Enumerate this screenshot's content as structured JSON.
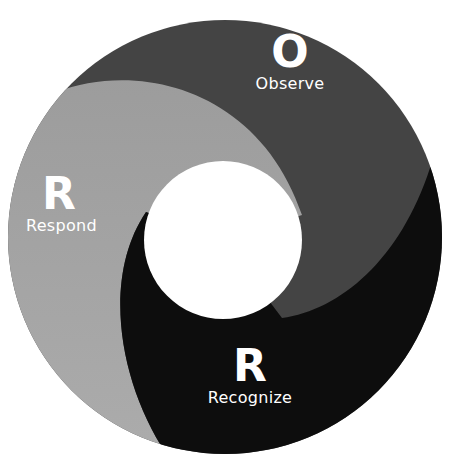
{
  "diagram": {
    "colors": {
      "observe": "#444444",
      "respond_top": "#999999",
      "respond_bottom": "#aaaaaa",
      "recognize": "#0d0d0d",
      "center": "#ffffff",
      "text": "#ffffff"
    },
    "segments": [
      {
        "id": "observe",
        "letter": "O",
        "label": "Observe"
      },
      {
        "id": "respond",
        "letter": "R",
        "label": "Respond"
      },
      {
        "id": "recognize",
        "letter": "R",
        "label": "Recognize"
      }
    ]
  }
}
